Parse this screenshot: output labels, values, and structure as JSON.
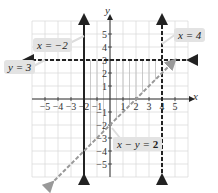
{
  "chart_data": {
    "type": "line",
    "title": "",
    "xlabel": "x",
    "ylabel": "y",
    "xlim": [
      -6,
      6
    ],
    "ylim": [
      -6,
      6
    ],
    "grid": true,
    "x_ticks": [
      -5,
      -4,
      -3,
      -2,
      -1,
      1,
      2,
      3,
      4,
      5
    ],
    "y_ticks": [
      5,
      4,
      3,
      2,
      1,
      -1,
      -2,
      -3,
      -4,
      -5
    ],
    "x_tick_labels": [
      "−5",
      "−4",
      "−3",
      "−2",
      "−1",
      "1",
      "2",
      "3",
      "4",
      "5"
    ],
    "y_tick_labels": [
      "5",
      "4",
      "3",
      "2",
      "1",
      "−1",
      "−2",
      "−3",
      "−4",
      "−5"
    ],
    "series": [
      {
        "name": "x = −2",
        "equation": "x = -2",
        "style": "solid",
        "kind": "vertical",
        "value": -2
      },
      {
        "name": "y = 3",
        "equation": "y = 3",
        "style": "dashed",
        "kind": "horizontal",
        "value": 3
      },
      {
        "name": "x = 4",
        "equation": "x = 4",
        "style": "dashed",
        "kind": "vertical",
        "value": 4
      },
      {
        "name": "x − y = 2",
        "equation": "y = x - 2",
        "style": "dashed-gray",
        "kind": "oblique",
        "slope": 1,
        "intercept": -2
      }
    ],
    "shaded_region": {
      "description": "x >= -2, x < 4, y < 3, x - y < 2",
      "vertices": [
        [
          -2,
          3
        ],
        [
          4,
          3
        ],
        [
          4,
          2
        ],
        [
          -2,
          -4
        ]
      ]
    },
    "annotations": [
      {
        "text": "x = −2",
        "position": "upper-left"
      },
      {
        "text": "y = 3",
        "position": "left"
      },
      {
        "text": "x = 4",
        "position": "upper-right"
      },
      {
        "text": "x − y = 2",
        "position": "lower-right"
      }
    ]
  },
  "labels": {
    "x_neg2": "x = −2",
    "y_3": "y = 3",
    "x_4": "x = 4",
    "x_minus_y_lhs": "x − y = ",
    "x_minus_y_rhs": "2",
    "axis_x": "x",
    "axis_y": "y"
  }
}
